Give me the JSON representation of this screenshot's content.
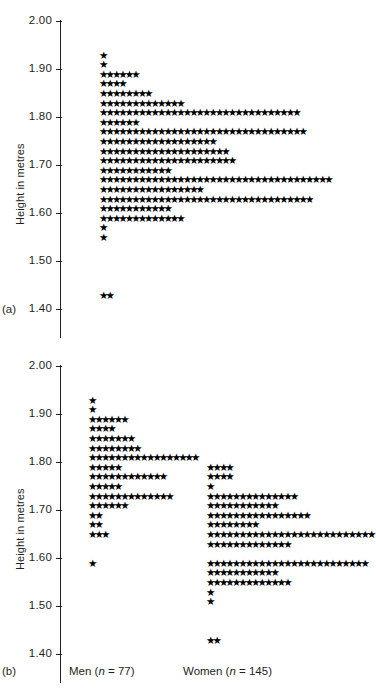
{
  "figure": {
    "axis_title": "Height in metres",
    "tick_labels": [
      "2.00",
      "1.90",
      "1.80",
      "1.70",
      "1.60",
      "1.50",
      "1.40"
    ],
    "tick_values": [
      2.0,
      1.9,
      1.8,
      1.7,
      1.6,
      1.5,
      1.4
    ],
    "panel_a_label": "(a)",
    "panel_b_label": "(b)",
    "star_glyph": "★",
    "axis_color": "#231f20",
    "star_color": "#000000"
  },
  "groups": {
    "men_label_text": "Men (",
    "men_label_n": "n",
    "men_label_eq": " = 77)",
    "women_label_text": "Women (",
    "women_label_n": "n",
    "women_label_eq": " = 145)"
  },
  "chart_data": [
    {
      "type": "scatter",
      "subtype": "dot-plot",
      "panel": "(a)",
      "title": "",
      "xlabel": "",
      "ylabel": "Height in metres",
      "ylim": [
        1.4,
        2.0
      ],
      "ytick_labels": [
        "2.00",
        "1.90",
        "1.80",
        "1.70",
        "1.60",
        "1.50",
        "1.40"
      ],
      "yticks": [
        2.0,
        1.9,
        1.8,
        1.7,
        1.6,
        1.5,
        1.4
      ],
      "grid": false,
      "legend": "none",
      "bin_width": 0.02,
      "marker": "star",
      "total_n": 222,
      "series": [
        {
          "name": "All students",
          "bins": [
            1.93,
            1.91,
            1.89,
            1.87,
            1.85,
            1.83,
            1.81,
            1.79,
            1.77,
            1.75,
            1.73,
            1.71,
            1.69,
            1.67,
            1.65,
            1.63,
            1.61,
            1.59,
            1.57,
            1.55,
            1.53,
            1.51,
            1.49,
            1.47,
            1.43,
            1.41
          ],
          "counts": [
            1,
            1,
            6,
            4,
            8,
            13,
            31,
            6,
            32,
            18,
            20,
            21,
            11,
            36,
            16,
            33,
            11,
            13,
            1,
            1,
            0,
            0,
            0,
            0,
            2,
            0
          ]
        }
      ]
    },
    {
      "type": "scatter",
      "subtype": "dot-plot",
      "panel": "(b)",
      "title": "",
      "xlabel": "",
      "ylabel": "Height in metres",
      "ylim": [
        1.4,
        2.0
      ],
      "ytick_labels": [
        "2.00",
        "1.90",
        "1.80",
        "1.70",
        "1.60",
        "1.50",
        "1.40"
      ],
      "yticks": [
        2.0,
        1.9,
        1.8,
        1.7,
        1.6,
        1.5,
        1.4
      ],
      "grid": false,
      "legend": "below-axis",
      "bin_width": 0.02,
      "marker": "star",
      "series": [
        {
          "name": "Men (n = 77)",
          "n": 77,
          "bins": [
            1.93,
            1.91,
            1.89,
            1.87,
            1.85,
            1.83,
            1.81,
            1.79,
            1.77,
            1.75,
            1.73,
            1.71,
            1.69,
            1.67,
            1.65,
            1.63,
            1.61,
            1.59,
            1.57
          ],
          "counts": [
            1,
            1,
            6,
            4,
            7,
            8,
            17,
            5,
            12,
            5,
            13,
            6,
            2,
            2,
            3,
            0,
            0,
            1,
            0
          ]
        },
        {
          "name": "Women (n = 145)",
          "n": 145,
          "bins": [
            1.81,
            1.79,
            1.77,
            1.75,
            1.73,
            1.71,
            1.69,
            1.67,
            1.65,
            1.63,
            1.61,
            1.59,
            1.57,
            1.55,
            1.53,
            1.51,
            1.49,
            1.47,
            1.43,
            1.41
          ],
          "counts": [
            0,
            4,
            4,
            1,
            14,
            11,
            16,
            8,
            26,
            13,
            0,
            25,
            11,
            13,
            1,
            1,
            0,
            0,
            2,
            0
          ]
        }
      ]
    }
  ]
}
